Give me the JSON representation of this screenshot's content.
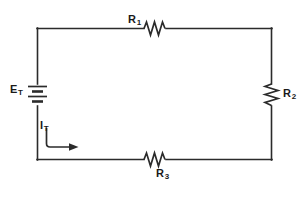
{
  "figure": {
    "name": "series-circuit-diagram",
    "type": "schematic",
    "background_color": "#ffffff",
    "wire_color": "#2b2b2b",
    "label_color": "#1a1a1a"
  },
  "labels": {
    "source": {
      "symbol": "E",
      "subscript": "T"
    },
    "current": {
      "symbol": "I",
      "subscript": "T"
    },
    "r1": {
      "symbol": "R",
      "subscript": "1"
    },
    "r2": {
      "symbol": "R",
      "subscript": "2"
    },
    "r3": {
      "symbol": "R",
      "subscript": "3"
    }
  },
  "components": [
    {
      "id": "battery",
      "name": "battery-symbol",
      "label": "E_T",
      "position": "left"
    },
    {
      "id": "r1",
      "name": "resistor-r1",
      "label": "R_1",
      "position": "top",
      "orientation": "horizontal"
    },
    {
      "id": "r2",
      "name": "resistor-r2",
      "label": "R_2",
      "position": "right",
      "orientation": "vertical"
    },
    {
      "id": "r3",
      "name": "resistor-r3",
      "label": "R_3",
      "position": "bottom",
      "orientation": "horizontal"
    },
    {
      "id": "current-arrow",
      "name": "current-direction-arrow",
      "label": "I_T",
      "direction": "clockwise"
    }
  ]
}
